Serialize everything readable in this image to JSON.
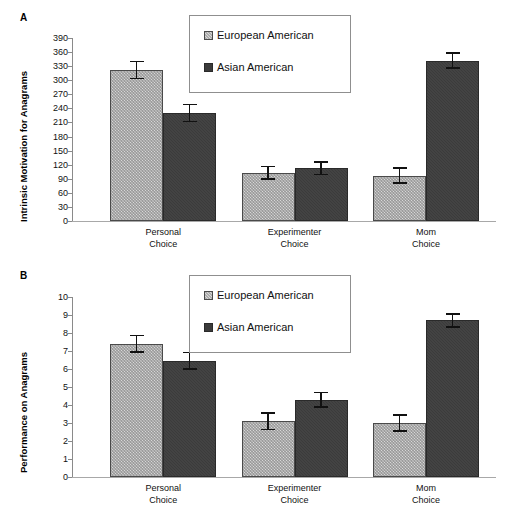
{
  "figure": {
    "panels": [
      {
        "letter": "A",
        "ylabel": "Intrinsic Motivation for Anagrams",
        "yticks": [
          "390",
          "360",
          "330",
          "300",
          "270",
          "240",
          "210",
          "180",
          "150",
          "120",
          "90",
          "60",
          "30",
          "0"
        ],
        "xticklabels": [
          "Personal\nChoice",
          "Experimenter\nChoice",
          "Mom\nChoice"
        ],
        "legend": [
          {
            "label": "European American",
            "swatch": "light-hatched-swatch"
          },
          {
            "label": "Asian American",
            "swatch": "dark-solid-swatch"
          }
        ]
      },
      {
        "letter": "B",
        "ylabel": "Performance on Anagrams",
        "yticks": [
          "10",
          "9",
          "8",
          "7",
          "6",
          "5",
          "4",
          "3",
          "2",
          "1",
          "0"
        ],
        "xticklabels": [
          "Personal\nChoice",
          "Experimenter\nChoice",
          "Mom\nChoice"
        ],
        "legend": [
          {
            "label": "European American",
            "swatch": "light-hatched-swatch"
          },
          {
            "label": "Asian American",
            "swatch": "dark-solid-swatch"
          }
        ]
      }
    ]
  },
  "colors": {
    "european_american_fill": "#d8d8d8",
    "asian_american_fill": "#3b3b3b",
    "bar_outline": "#3a3a3a",
    "axis": "#8a8a8a",
    "text": "#111111",
    "legend_border": "#8f8f8f",
    "background": "#ffffff"
  },
  "chart_data": [
    {
      "type": "bar",
      "panel": "A",
      "title": "",
      "xlabel": "",
      "ylabel": "Intrinsic Motivation for Anagrams",
      "ylim": [
        0,
        390
      ],
      "ytick_step": 30,
      "grid": false,
      "legend_position": "top-center-inside",
      "categories": [
        "Personal Choice",
        "Experimenter Choice",
        "Mom Choice"
      ],
      "series": [
        {
          "name": "European American",
          "values": [
            322,
            103,
            97
          ],
          "errors": [
            20,
            15,
            18
          ]
        },
        {
          "name": "Asian American",
          "values": [
            230,
            112,
            342
          ],
          "errors": [
            20,
            15,
            18
          ]
        }
      ]
    },
    {
      "type": "bar",
      "panel": "B",
      "title": "",
      "xlabel": "",
      "ylabel": "Performance on Anagrams",
      "ylim": [
        0,
        10
      ],
      "ytick_step": 1,
      "grid": false,
      "legend_position": "top-center-inside",
      "categories": [
        "Personal Choice",
        "Experimenter Choice",
        "Mom Choice"
      ],
      "series": [
        {
          "name": "European American",
          "values": [
            7.4,
            3.1,
            3.0
          ],
          "errors": [
            0.5,
            0.5,
            0.5
          ]
        },
        {
          "name": "Asian American",
          "values": [
            6.45,
            4.3,
            8.7
          ],
          "errors": [
            0.5,
            0.45,
            0.4
          ]
        }
      ]
    }
  ]
}
